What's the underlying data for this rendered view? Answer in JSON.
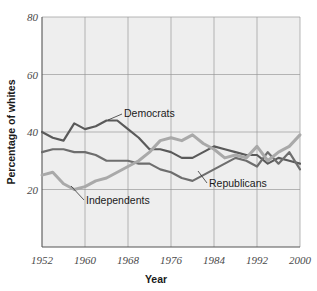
{
  "chart_data": {
    "type": "line",
    "title": "",
    "xlabel": "Year",
    "ylabel": "Percentage of whites",
    "xlim": [
      1952,
      2000
    ],
    "ylim": [
      0,
      80
    ],
    "grid": true,
    "legend_position": "inline-annotations",
    "x_ticks": [
      "1952",
      "1960",
      "1968",
      "1976",
      "1984",
      "1992",
      "2000"
    ],
    "x_tick_values": [
      1952,
      1960,
      1968,
      1976,
      1984,
      1992,
      2000
    ],
    "y_ticks": [
      "20",
      "40",
      "60",
      "80"
    ],
    "y_tick_values": [
      20,
      40,
      60,
      80
    ],
    "x": [
      1952,
      1954,
      1956,
      1958,
      1960,
      1962,
      1964,
      1966,
      1968,
      1970,
      1972,
      1974,
      1976,
      1978,
      1980,
      1982,
      1984,
      1986,
      1988,
      1990,
      1992,
      1994,
      1996,
      1998,
      2000
    ],
    "series": [
      {
        "name": "Democrats",
        "color": "#5a5a5a",
        "values": [
          40,
          38,
          37,
          43,
          41,
          42,
          44,
          44,
          41,
          38,
          34,
          34,
          33,
          31,
          31,
          33,
          35,
          34,
          33,
          32,
          32,
          29,
          31,
          30,
          29
        ]
      },
      {
        "name": "Republicans",
        "color": "#6e6e6e",
        "values": [
          33,
          34,
          34,
          33,
          33,
          32,
          30,
          30,
          30,
          29,
          29,
          27,
          26,
          24,
          23,
          25,
          27,
          29,
          31,
          30,
          28,
          33,
          29,
          33,
          27
        ]
      },
      {
        "name": "Independents",
        "color": "#a9a9a9",
        "values": [
          25,
          26,
          22,
          20,
          21,
          23,
          24,
          26,
          28,
          30,
          33,
          37,
          38,
          37,
          39,
          36,
          34,
          31,
          32,
          31,
          35,
          30,
          33,
          35,
          39
        ]
      }
    ],
    "annotations": [
      {
        "label": "Democrats",
        "series": "Democrats"
      },
      {
        "label": "Republicans",
        "series": "Republicans"
      },
      {
        "label": "Independents",
        "series": "Independents"
      }
    ]
  }
}
